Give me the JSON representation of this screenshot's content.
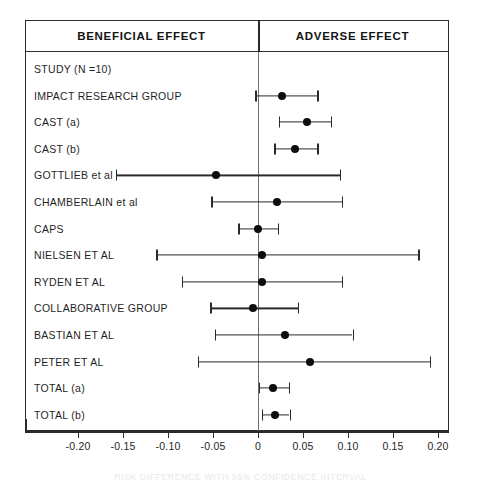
{
  "figure": {
    "header": {
      "beneficial_label": "BENEFICIAL EFFECT",
      "adverse_label": "ADVERSE EFFECT"
    },
    "caption": "RISK DIFFERENCE WITH 95% CONFIDENCE INTERVAL"
  },
  "chart_data": {
    "type": "scatter",
    "plot_kind": "forest-plot",
    "title": "",
    "xlabel": "RISK DIFFERENCE WITH 95% CONFIDENCE INTERVAL",
    "ylabel": "",
    "xlim": [
      -0.225,
      0.225
    ],
    "xticks": [
      -0.2,
      -0.15,
      -0.1,
      -0.05,
      0,
      0.05,
      0.1,
      0.15,
      0.2
    ],
    "xticklabels": [
      "-0.20",
      "-0.15",
      "-0.10",
      "-0.05",
      "0",
      "0.05",
      "0.10",
      "0.15",
      "0.20"
    ],
    "grid": false,
    "reference_line": 0,
    "legend": [],
    "annotations": [
      "BENEFICIAL EFFECT",
      "ADVERSE EFFECT"
    ],
    "rows": [
      {
        "label": "STUDY (N =10)",
        "estimate": null,
        "ci_low": null,
        "ci_high": null,
        "has_marker": false
      },
      {
        "label": "IMPACT RESEARCH GROUP",
        "estimate": 0.027,
        "ci_low": -0.003,
        "ci_high": 0.066,
        "has_marker": true
      },
      {
        "label": "CAST (a)",
        "estimate": 0.054,
        "ci_low": 0.023,
        "ci_high": 0.081,
        "has_marker": true
      },
      {
        "label": "CAST (b)",
        "estimate": 0.041,
        "ci_low": 0.018,
        "ci_high": 0.066,
        "has_marker": true
      },
      {
        "label": "GOTTLIEB et al",
        "estimate": -0.047,
        "ci_low": -0.158,
        "ci_high": 0.091,
        "has_marker": true
      },
      {
        "label": "CHAMBERLAIN et al",
        "estimate": 0.021,
        "ci_low": -0.052,
        "ci_high": 0.093,
        "has_marker": true
      },
      {
        "label": "CAPS",
        "estimate": 0.0,
        "ci_low": -0.022,
        "ci_high": 0.022,
        "has_marker": true
      },
      {
        "label": "NIELSEN ET AL",
        "estimate": 0.004,
        "ci_low": -0.113,
        "ci_high": 0.178,
        "has_marker": true
      },
      {
        "label": "RYDEN ET AL",
        "estimate": 0.004,
        "ci_low": -0.085,
        "ci_high": 0.093,
        "has_marker": true
      },
      {
        "label": "COLLABORATIVE GROUP",
        "estimate": -0.006,
        "ci_low": -0.053,
        "ci_high": 0.044,
        "has_marker": true
      },
      {
        "label": "BASTIAN ET AL",
        "estimate": 0.03,
        "ci_low": -0.048,
        "ci_high": 0.105,
        "has_marker": true
      },
      {
        "label": "PETER ET AL",
        "estimate": 0.058,
        "ci_low": -0.067,
        "ci_high": 0.191,
        "has_marker": true
      },
      {
        "label": "TOTAL (a)",
        "estimate": 0.017,
        "ci_low": 0.001,
        "ci_high": 0.034,
        "has_marker": true
      },
      {
        "label": "TOTAL (b)",
        "estimate": 0.019,
        "ci_low": 0.004,
        "ci_high": 0.035,
        "has_marker": true
      }
    ]
  }
}
